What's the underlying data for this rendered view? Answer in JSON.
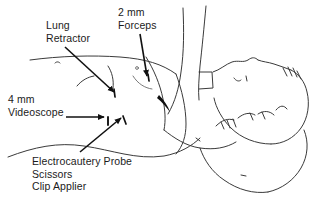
{
  "figure": {
    "kind": "medical-line-illustration",
    "ink_color": "#1b1b1b",
    "background_color": "#ffffff",
    "width": 317,
    "height": 199
  },
  "labels": {
    "lung_retractor": {
      "line1": "Lung",
      "line2": "Retractor"
    },
    "forceps": {
      "line1": "2 mm",
      "line2": "Forceps"
    },
    "videoscope": {
      "line1": "4 mm",
      "line2": "Videoscope"
    },
    "instruments": {
      "line1": "Electrocautery Probe",
      "line2": "Scissors",
      "line3": "Clip Applier"
    }
  },
  "leaders": [
    {
      "name": "lung-retractor-arrow",
      "direction": "diagonal-down-right"
    },
    {
      "name": "forceps-arrow",
      "direction": "vertical-down"
    },
    {
      "name": "videoscope-arrow",
      "direction": "horizontal-right"
    },
    {
      "name": "instruments-arrow",
      "direction": "diagonal-up-right"
    }
  ],
  "port_sites": [
    {
      "name": "lung-retractor-port"
    },
    {
      "name": "forceps-port"
    },
    {
      "name": "videoscope-port"
    },
    {
      "name": "instruments-port"
    }
  ]
}
